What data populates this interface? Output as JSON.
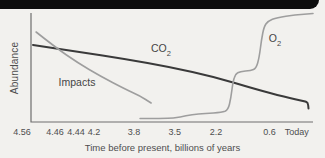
{
  "chart_data": {
    "type": "line",
    "title": "",
    "xlabel": "Time before present, billions of years",
    "ylabel": "Abundance",
    "x_scale": "nonlinear time axis, no tick marks drawn",
    "y_scale": "qualitative abundance, no numeric ticks",
    "axis_color": "#6e6e6e",
    "x_ticks": [
      {
        "label": "4.56",
        "pos": 0.068
      },
      {
        "label": "4.46",
        "pos": 0.169
      },
      {
        "label": "4.44",
        "pos": 0.234
      },
      {
        "label": "4.2",
        "pos": 0.289
      },
      {
        "label": "3.8",
        "pos": 0.412
      },
      {
        "label": "3.5",
        "pos": 0.538
      },
      {
        "label": "2.2",
        "pos": 0.665
      },
      {
        "label": "0.6",
        "pos": 0.829
      },
      {
        "label": "Today",
        "pos": 0.913
      }
    ],
    "series": [
      {
        "name": "CO2",
        "label_main": "CO",
        "label_sub": "2",
        "color": "#3a3a3a",
        "width": 2,
        "description": "Slow steady decline from formation to today, ends with small downward hook arrow",
        "points": [
          [
            0.007,
            0.706
          ],
          [
            0.174,
            0.642
          ],
          [
            0.333,
            0.578
          ],
          [
            0.493,
            0.505
          ],
          [
            0.652,
            0.413
          ],
          [
            0.794,
            0.303
          ],
          [
            0.901,
            0.229
          ],
          [
            0.972,
            0.188
          ],
          [
            0.982,
            0.179
          ],
          [
            0.984,
            0.124
          ]
        ]
      },
      {
        "name": "Impacts",
        "label_main": "Impacts",
        "label_sub": "",
        "color": "#9e9e9e",
        "width": 1.6,
        "description": "Steep decline from 4.56 ending between 3.8 and 3.5",
        "points": [
          [
            0.018,
            0.826
          ],
          [
            0.085,
            0.688
          ],
          [
            0.167,
            0.541
          ],
          [
            0.245,
            0.422
          ],
          [
            0.333,
            0.303
          ],
          [
            0.387,
            0.239
          ],
          [
            0.426,
            0.174
          ]
        ]
      },
      {
        "name": "O2",
        "label_main": "O",
        "label_sub": "2",
        "color": "#9e9e9e",
        "width": 1.6,
        "description": "Near zero from 3.8, small rise, step up near 2.2 to middle plateau, second step near 0.6 to high plateau today",
        "points": [
          [
            0.387,
            0.032
          ],
          [
            0.493,
            0.032
          ],
          [
            0.528,
            0.046
          ],
          [
            0.571,
            0.069
          ],
          [
            0.617,
            0.078
          ],
          [
            0.677,
            0.087
          ],
          [
            0.699,
            0.11
          ],
          [
            0.709,
            0.22
          ],
          [
            0.716,
            0.367
          ],
          [
            0.725,
            0.44
          ],
          [
            0.741,
            0.463
          ],
          [
            0.78,
            0.472
          ],
          [
            0.798,
            0.491
          ],
          [
            0.809,
            0.587
          ],
          [
            0.817,
            0.752
          ],
          [
            0.826,
            0.872
          ],
          [
            0.84,
            0.927
          ],
          [
            0.872,
            0.959
          ],
          [
            0.936,
            0.982
          ],
          [
            1.0,
            0.995
          ]
        ]
      }
    ]
  }
}
